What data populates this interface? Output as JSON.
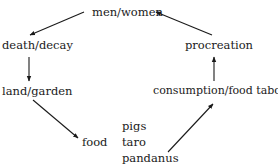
{
  "diagram": {
    "type": "cycle",
    "nodes": {
      "men_women": "men/women",
      "death_decay": "death/decay",
      "land_garden": "land/garden",
      "food": "food",
      "food_items": [
        "pigs",
        "taro",
        "pandanus"
      ],
      "consumption": "consumption/food taboos",
      "procreation": "procreation"
    },
    "edges": [
      {
        "from": "men/women",
        "to": "death/decay"
      },
      {
        "from": "death/decay",
        "to": "land/garden"
      },
      {
        "from": "land/garden",
        "to": "food"
      },
      {
        "from": "pandanus",
        "to": "consumption/food taboos"
      },
      {
        "from": "consumption/food taboos",
        "to": "procreation"
      },
      {
        "from": "procreation",
        "to": "men/women"
      }
    ],
    "colors": {
      "text": "#1a1a1a",
      "arrow": "#1a1a1a",
      "background": "#ffffff"
    }
  }
}
